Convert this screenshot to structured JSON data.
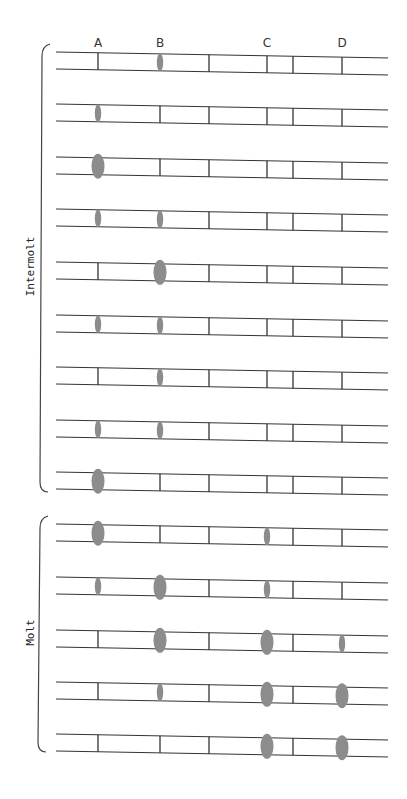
{
  "columns": [
    {
      "label": "A",
      "x": 98
    },
    {
      "label": "B",
      "x": 160
    },
    {
      "label": "C",
      "x": 267
    },
    {
      "label": "D",
      "x": 342
    }
  ],
  "extra_dividers_x": [
    209,
    293
  ],
  "lane_x_start": 56,
  "lane_x_end": 388,
  "lane_height": 17,
  "band_color": "#8c8c8c",
  "line_color": "#333333",
  "groups": [
    {
      "label": "Intermolt",
      "y_start": 44,
      "y_end": 492,
      "lanes": [
        {
          "y": 52,
          "bands": {
            "A": "none",
            "B": "small",
            "C": "none",
            "D": "none"
          }
        },
        {
          "y": 104,
          "bands": {
            "A": "small",
            "B": "none",
            "C": "none",
            "D": "none"
          }
        },
        {
          "y": 157,
          "bands": {
            "A": "large",
            "B": "none",
            "C": "none",
            "D": "none"
          }
        },
        {
          "y": 209,
          "bands": {
            "A": "small",
            "B": "small",
            "C": "none",
            "D": "none"
          }
        },
        {
          "y": 262,
          "bands": {
            "A": "none",
            "B": "large",
            "C": "none",
            "D": "none"
          }
        },
        {
          "y": 315,
          "bands": {
            "A": "small",
            "B": "small",
            "C": "none",
            "D": "none"
          }
        },
        {
          "y": 367,
          "bands": {
            "A": "none",
            "B": "small",
            "C": "none",
            "D": "none"
          }
        },
        {
          "y": 420,
          "bands": {
            "A": "small",
            "B": "small",
            "C": "none",
            "D": "none"
          }
        },
        {
          "y": 472,
          "bands": {
            "A": "large",
            "B": "none",
            "C": "none",
            "D": "none"
          }
        }
      ]
    },
    {
      "label": "Molt",
      "y_start": 516,
      "y_end": 752,
      "lanes": [
        {
          "y": 524,
          "bands": {
            "A": "large",
            "B": "none",
            "C": "small",
            "D": "none"
          }
        },
        {
          "y": 577,
          "bands": {
            "A": "small",
            "B": "large",
            "C": "small",
            "D": "none"
          }
        },
        {
          "y": 630,
          "bands": {
            "A": "none",
            "B": "large",
            "C": "large",
            "D": "small"
          }
        },
        {
          "y": 682,
          "bands": {
            "A": "none",
            "B": "small",
            "C": "large",
            "D": "large"
          }
        },
        {
          "y": 734,
          "bands": {
            "A": "none",
            "B": "none",
            "C": "large",
            "D": "large"
          }
        }
      ]
    }
  ]
}
